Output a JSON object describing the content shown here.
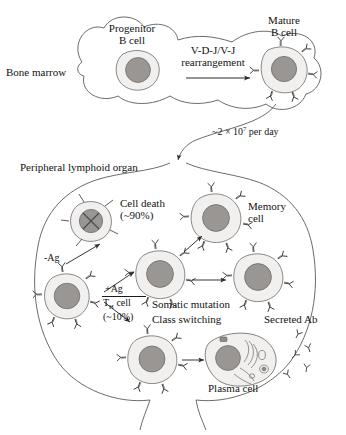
{
  "figure": {
    "type": "biology-schematic"
  },
  "colors": {
    "nucleus": "#999693",
    "nucleus_stroke": "#6e6b68",
    "cytoplasm": "#f2f0ee",
    "outline": "#4a4a4a",
    "text": "#121212",
    "organelle": "#8d8a87",
    "background": "#ffffff"
  },
  "regions": {
    "bone_marrow": {
      "label": "Bone marrow",
      "shape": "bone-shaped outline"
    },
    "peripheral": {
      "label": "Peripheral lymphoid organ",
      "shape": "large oval outline"
    }
  },
  "cells": {
    "progenitor": {
      "label_line1": "Progenitor",
      "label_line2": "B cell",
      "receptors": 0
    },
    "mature": {
      "label_line1": "Mature",
      "label_line2": "B cell",
      "receptors": 6
    },
    "dead": {
      "label_line1": "Cell death",
      "label_line2": "(~90%)",
      "mark": "X",
      "receptors": 4
    },
    "memory": {
      "label_line1": "Memory",
      "label_line2": "cell",
      "receptors": 6
    },
    "activated": {
      "receptors": 6
    },
    "daughter": {
      "receptors": 6
    },
    "naive": {
      "receptors": 6
    },
    "switching": {
      "receptors": 6
    },
    "plasma": {
      "label": "Plasma cell",
      "organelles": "rough ER and Golgi"
    }
  },
  "annotations": {
    "rearrangement_line1": "V-D-J/V-J",
    "rearrangement_line2": "rearrangement",
    "output_rate": "~2 × 10",
    "output_rate_exp": "7",
    "output_rate_tail": " per day",
    "minus_ag": "-Ag",
    "plus_ag": "+Ag",
    "th_cell": "T",
    "th_cell_sub": "H",
    "th_cell_tail": " cell",
    "th_percent": "(~10%)",
    "somatic_mutation": "Somatic mutation",
    "class_switching": "Class switching",
    "secreted_ab": "Secreted Ab"
  }
}
